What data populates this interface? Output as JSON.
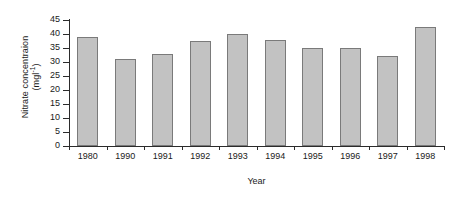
{
  "chart_data": {
    "type": "bar",
    "title": "",
    "categories": [
      "1980",
      "1990",
      "1991",
      "1992",
      "1993",
      "1994",
      "1995",
      "1996",
      "1997",
      "1998"
    ],
    "values": [
      39,
      31,
      33,
      37.5,
      40,
      38,
      35,
      35,
      32,
      42.5
    ],
    "xlabel": "Year",
    "ylabel_line1": "Nitrate concentraion",
    "ylabel_line2_prefix": "(mgl",
    "ylabel_line2_sup": "-1",
    "ylabel_line2_suffix": ")",
    "ylim": [
      0,
      45
    ],
    "yticks": [
      0,
      5,
      10,
      15,
      20,
      25,
      30,
      35,
      40,
      45
    ],
    "ytick_labels": [
      "0",
      "5",
      "10",
      "15",
      "20",
      "25",
      "30",
      "35",
      "40",
      "45"
    ],
    "grid": false,
    "legend": "none",
    "bar_fill_color": "#c2c2c2",
    "bar_border_color": "#7a7a7a",
    "axis_color": "#2b2b2b",
    "background_color": "#ffffff"
  }
}
